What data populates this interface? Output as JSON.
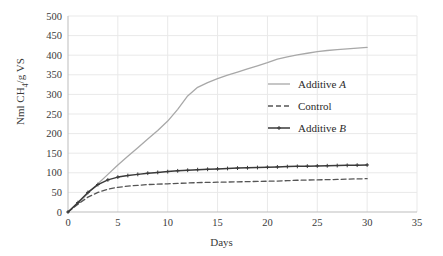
{
  "chart_data": {
    "type": "line",
    "title": "",
    "xlabel": "Days",
    "ylabel": "Nml CH4/g VS",
    "ylabel_parts": {
      "pre": "Nml CH",
      "sub": "4",
      "post": "/g VS"
    },
    "xlim": [
      0,
      35
    ],
    "ylim": [
      0,
      500
    ],
    "xticks": [
      0,
      5,
      10,
      15,
      20,
      25,
      30,
      35
    ],
    "yticks": [
      0,
      50,
      100,
      150,
      200,
      250,
      300,
      350,
      400,
      450,
      500
    ],
    "grid": true,
    "legend_position": "center-right",
    "x": [
      0,
      1,
      2,
      3,
      4,
      5,
      6,
      7,
      8,
      9,
      10,
      11,
      12,
      13,
      14,
      15,
      16,
      17,
      18,
      19,
      20,
      21,
      22,
      23,
      24,
      25,
      26,
      27,
      28,
      29,
      30
    ],
    "series": [
      {
        "name": "Additive A",
        "name_prefix": "Additive ",
        "name_italic": "A",
        "style": "solid",
        "color": "#a8a8a8",
        "marker": "none",
        "values": [
          0,
          22,
          48,
          72,
          96,
          120,
          142,
          164,
          186,
          208,
          232,
          262,
          296,
          318,
          330,
          340,
          349,
          357,
          365,
          373,
          381,
          390,
          396,
          401,
          405,
          409,
          412,
          414,
          416,
          418,
          420
        ]
      },
      {
        "name": "Control",
        "name_prefix": "Control",
        "name_italic": "",
        "style": "dashed",
        "color": "#555555",
        "marker": "none",
        "values": [
          0,
          20,
          38,
          50,
          58,
          63,
          66,
          68,
          70,
          71,
          72,
          73,
          74,
          75,
          75.5,
          76,
          76.5,
          77,
          77.5,
          78,
          78.5,
          79,
          80,
          81,
          81.5,
          82,
          82.5,
          83,
          84,
          84.5,
          85
        ]
      },
      {
        "name": "Additive B",
        "name_prefix": "Additive ",
        "name_italic": "B",
        "style": "solid-marker",
        "color": "#3a3a3a",
        "marker": "plus",
        "values": [
          0,
          24,
          50,
          70,
          82,
          89,
          93,
          96,
          99,
          101,
          103,
          105,
          106.5,
          108,
          109,
          110,
          111,
          112,
          112.8,
          113.5,
          114.2,
          115,
          115.8,
          116.4,
          117,
          117.5,
          118,
          118.5,
          119,
          119.5,
          120
        ]
      }
    ]
  },
  "axis": {
    "tick_color": "#3a3a3a",
    "grid_color": "#e9e9e9",
    "axis_line_color": "#bdbdbd"
  }
}
